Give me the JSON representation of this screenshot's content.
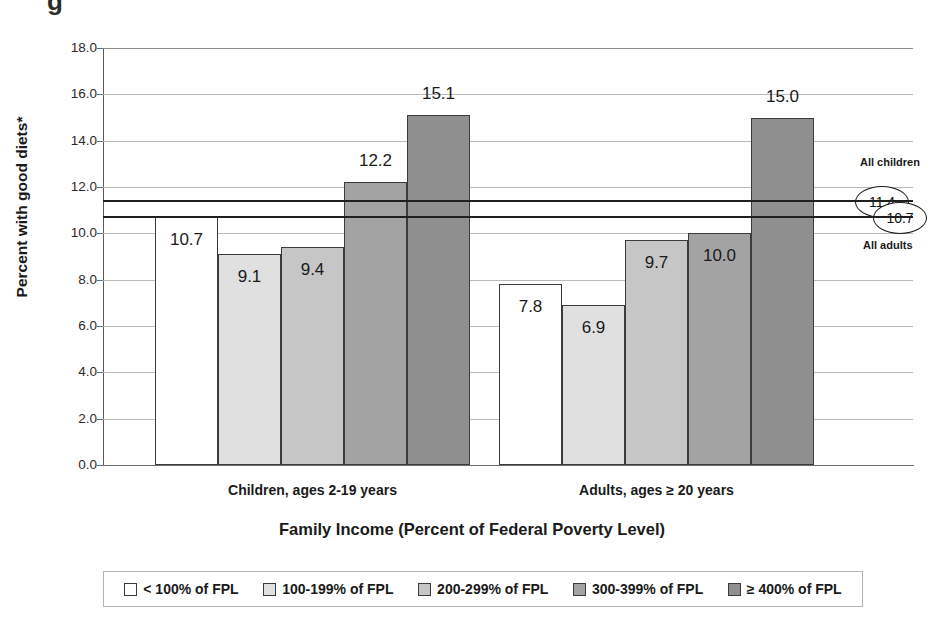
{
  "figure": {
    "top_clipped_glyph": "g"
  },
  "axes": {
    "y_title": "Percent with good diets*",
    "x_title": "Family Income (Percent of Federal Poverty Level)",
    "y_ticks": [
      "18.0",
      "16.0",
      "14.0",
      "12.0",
      "10.0",
      "8.0",
      "6.0",
      "4.0",
      "2.0",
      "0.0"
    ],
    "y_min": 0.0,
    "y_max": 18.0
  },
  "groups": [
    {
      "label": "Children, ages 2-19 years"
    },
    {
      "label": "Adults, ages ≥ 20 years"
    }
  ],
  "legend": {
    "items": [
      {
        "label": "< 100% of FPL",
        "color": "#ffffff"
      },
      {
        "label": "100-199% of FPL",
        "color": "#e0e0e0"
      },
      {
        "label": "200-299% of FPL",
        "color": "#c6c6c6"
      },
      {
        "label": "300-399% of FPL",
        "color": "#a3a3a3"
      },
      {
        "label": "≥ 400% of FPL",
        "color": "#8f8f8f"
      }
    ]
  },
  "reference_lines": [
    {
      "name": "all-children",
      "value": 11.4,
      "value_label": "11.4",
      "caption": "All children"
    },
    {
      "name": "all-adults",
      "value": 10.7,
      "value_label": "10.7",
      "caption": "All adults"
    }
  ],
  "chart_data": {
    "type": "bar",
    "title": "",
    "xlabel": "Family Income (Percent of Federal Poverty Level)",
    "ylabel": "Percent with good diets*",
    "ylim": [
      0.0,
      18.0
    ],
    "ytick_step": 2.0,
    "grid": true,
    "legend_position": "bottom",
    "categories": [
      "Children, ages 2-19 years",
      "Adults, ages ≥ 20 years"
    ],
    "series": [
      {
        "name": "< 100% of FPL",
        "color": "#ffffff",
        "values": [
          10.7,
          7.8
        ],
        "labels": [
          "10.7",
          "7.8"
        ]
      },
      {
        "name": "100-199% of FPL",
        "color": "#e0e0e0",
        "values": [
          9.1,
          6.9
        ],
        "labels": [
          "9.1",
          "6.9"
        ]
      },
      {
        "name": "200-299% of FPL",
        "color": "#c6c6c6",
        "values": [
          9.4,
          9.7
        ],
        "labels": [
          "9.4",
          "9.7"
        ]
      },
      {
        "name": "300-399% of FPL",
        "color": "#a3a3a3",
        "values": [
          12.2,
          10.0
        ],
        "labels": [
          "12.2",
          "10.0"
        ]
      },
      {
        "name": "≥ 400% of FPL",
        "color": "#8f8f8f",
        "values": [
          15.1,
          15.0
        ],
        "labels": [
          "15.1",
          "15.0"
        ]
      }
    ],
    "reference_lines": [
      {
        "label": "All children",
        "value": 11.4
      },
      {
        "label": "All adults",
        "value": 10.7
      }
    ],
    "annotations": [
      "Value labels are printed inside or above each bar.",
      "Two horizontal reference lines mark overall averages for all children (11.4) and all adults (10.7)."
    ]
  }
}
